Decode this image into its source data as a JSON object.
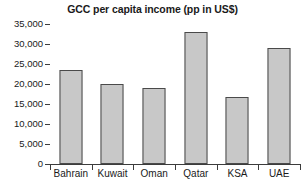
{
  "chart_data": {
    "type": "bar",
    "title": "GCC per capita income (pp in US$)",
    "xlabel": "",
    "ylabel": "",
    "categories": [
      "Bahrain",
      "Kuwait",
      "Oman",
      "Qatar",
      "KSA",
      "UAE"
    ],
    "values": [
      23600,
      20100,
      19000,
      32900,
      16800,
      29000
    ],
    "ylim": [
      0,
      35000
    ],
    "ytick_values": [
      35000,
      30000,
      25000,
      20000,
      15000,
      10000,
      5000,
      0
    ],
    "ytick_labels": [
      "35,000",
      "30,000",
      "25,000",
      "20,000",
      "15,000",
      "10,000",
      "5,000",
      "0"
    ],
    "grid": false,
    "legend": false,
    "bar_fill_color": "#c8c8c8",
    "bar_border_color": "#4a4a4a",
    "axis_color": "#3c3c3c",
    "text_color": "#1a1a1a",
    "background_color": "#ffffff"
  }
}
